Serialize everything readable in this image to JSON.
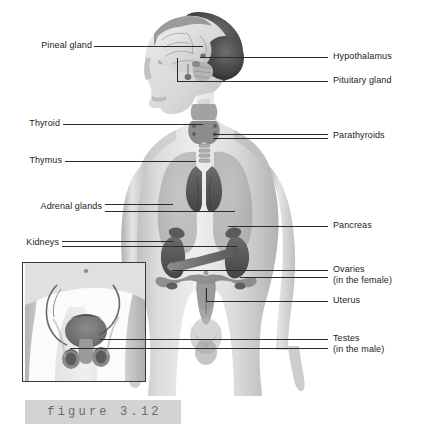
{
  "figure": {
    "caption": "figure 3.12",
    "background_color": "#ffffff",
    "line_color": "#2b2b2b",
    "text_color": "#1b1b1b",
    "caption_band_color": "#d3d3d3",
    "caption_text_color": "#6a6a6a"
  },
  "labels_left": [
    {
      "id": "pineal-gland",
      "text": "Pineal gland"
    },
    {
      "id": "thyroid",
      "text": "Thyroid"
    },
    {
      "id": "thymus",
      "text": "Thymus"
    },
    {
      "id": "adrenal-glands",
      "text": "Adrenal glands"
    },
    {
      "id": "kidneys",
      "text": "Kidneys"
    }
  ],
  "labels_right": [
    {
      "id": "hypothalamus",
      "text": "Hypothalamus",
      "sub": ""
    },
    {
      "id": "pituitary-gland",
      "text": "Pituitary gland",
      "sub": ""
    },
    {
      "id": "parathyroids",
      "text": "Parathyroids",
      "sub": ""
    },
    {
      "id": "pancreas",
      "text": "Pancreas",
      "sub": ""
    },
    {
      "id": "ovaries",
      "text": "Ovaries",
      "sub": "(in the female)"
    },
    {
      "id": "uterus",
      "text": "Uterus",
      "sub": ""
    },
    {
      "id": "testes",
      "text": "Testes",
      "sub": "(in the male)"
    }
  ],
  "inset": {
    "id": "male-pelvis-inset",
    "description": "Male pelvis inset showing testes"
  }
}
